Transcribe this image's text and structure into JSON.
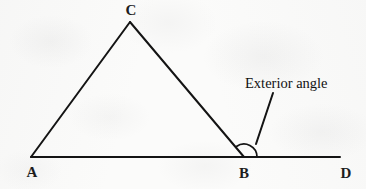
{
  "figure": {
    "background_color": "#fbfbfa",
    "ink_color": "#141414",
    "vertices": [
      {
        "name": "A",
        "label": "A",
        "x": 31,
        "y": 157,
        "label_x": 32,
        "label_y": 177
      },
      {
        "name": "B",
        "label": "B",
        "x": 244,
        "y": 157,
        "label_x": 244,
        "label_y": 178
      },
      {
        "name": "C",
        "label": "C",
        "x": 130,
        "y": 22,
        "label_x": 131,
        "label_y": 15
      },
      {
        "name": "D",
        "label": "D",
        "x": 340,
        "y": 157,
        "label_x": 346,
        "label_y": 178
      }
    ],
    "segments": [
      {
        "name": "segment-AC",
        "from": "A",
        "to": "C"
      },
      {
        "name": "segment-CB",
        "from": "C",
        "to": "B"
      },
      {
        "name": "segment-AD",
        "from": "A",
        "to": "D"
      }
    ],
    "angle_arc": {
      "name": "exterior-angle-arc",
      "center": "B",
      "radius": 13,
      "start_label": "ray BC",
      "end_label": "ray BD"
    },
    "callout": {
      "label": "Exterior angle",
      "text_x": 245,
      "text_y": 88,
      "leader_from_x": 273,
      "leader_from_y": 93,
      "leader_to_x": 256,
      "leader_to_y": 144
    }
  }
}
